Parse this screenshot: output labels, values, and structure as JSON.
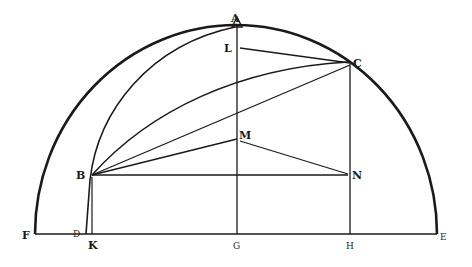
{
  "diagram": {
    "type": "geometric-construction",
    "colors": {
      "ink": "#1a1a1a",
      "paper": "#ffffff"
    },
    "points": {
      "A": {
        "label": "A",
        "x": 237,
        "y": 25
      },
      "L": {
        "label": "L",
        "x": 237,
        "y": 48
      },
      "C": {
        "label": "C",
        "x": 350,
        "y": 63
      },
      "M": {
        "label": "M",
        "x": 237,
        "y": 139
      },
      "B": {
        "label": "B",
        "x": 92,
        "y": 175
      },
      "N": {
        "label": "N",
        "x": 350,
        "y": 175
      },
      "F": {
        "label": "F",
        "x": 35,
        "y": 234
      },
      "D": {
        "label": "D",
        "x": 86,
        "y": 234
      },
      "K": {
        "label": "K",
        "x": 92,
        "y": 234
      },
      "G": {
        "label": "G",
        "x": 237,
        "y": 234
      },
      "H": {
        "label": "H",
        "x": 350,
        "y": 234
      },
      "E": {
        "label": "E",
        "x": 437,
        "y": 234
      }
    },
    "segments": [
      "FE",
      "AG",
      "LC",
      "BC",
      "BM",
      "MN",
      "BN",
      "CH",
      "BK"
    ],
    "arcs": [
      "FAE (semicircle)",
      "ABD (inner arc)",
      "BC (curve)"
    ]
  }
}
